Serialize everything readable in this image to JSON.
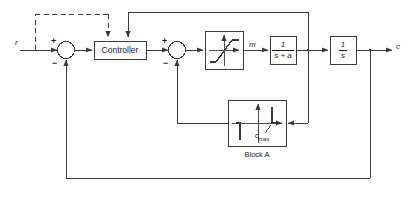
{
  "diagram": {
    "stroke_color": "#3a3a3a",
    "text_color": "#1a1a1a",
    "background": "#ffffff"
  },
  "signals": {
    "input_label": "r",
    "output_label": "c",
    "intermediate_label": "m"
  },
  "blocks": {
    "controller": {
      "label": "Controller"
    },
    "saturation": {
      "label": ""
    },
    "lag": {
      "numerator": "1",
      "denominator": "s + a"
    },
    "integrator": {
      "numerator": "1",
      "denominator": "s"
    },
    "block_a": {
      "caption": "Block A",
      "axis_label": "c",
      "axis_label_sub": "max"
    }
  },
  "summing_junctions": [
    {
      "name": "sum-1",
      "plus": "+",
      "minus": "−"
    },
    {
      "name": "sum-2",
      "plus": "+",
      "minus": "−"
    }
  ]
}
